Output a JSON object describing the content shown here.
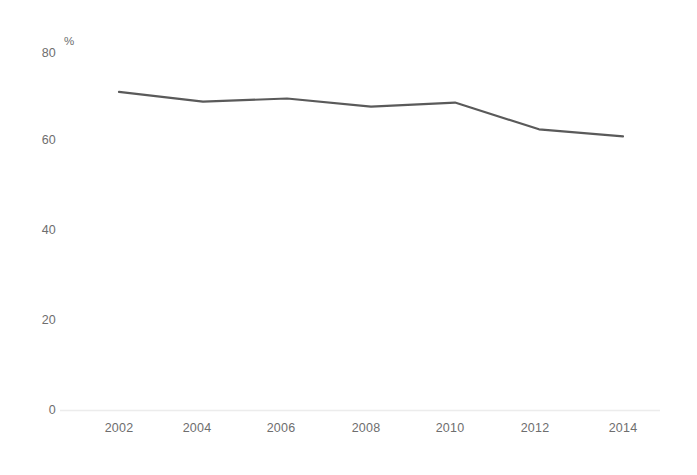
{
  "chart_data": {
    "type": "line",
    "title": "",
    "subtitle": "",
    "xlabel": "",
    "ylabel": "",
    "unit_label": "%",
    "x": [
      2002,
      2003,
      2004,
      2005,
      2006,
      2007,
      2008,
      2009,
      2010,
      2011,
      2012,
      2013,
      2014
    ],
    "categories": [
      "2002",
      "2004",
      "2006",
      "2008",
      "2010",
      "2012",
      "2014"
    ],
    "series": [
      {
        "name": "",
        "color": "#5a5a5a",
        "points": [
          {
            "x": 2002,
            "y": 71.3
          },
          {
            "x": 2004,
            "y": 69.1
          },
          {
            "x": 2006,
            "y": 69.8
          },
          {
            "x": 2008,
            "y": 68.0
          },
          {
            "x": 2010,
            "y": 68.9
          },
          {
            "x": 2012,
            "y": 62.9
          },
          {
            "x": 2014,
            "y": 61.3
          }
        ],
        "values": [
          71.3,
          69.1,
          69.8,
          68.0,
          68.9,
          62.9,
          61.3
        ]
      }
    ],
    "xlim": [
      2001.2,
      2015.0
    ],
    "ylim": [
      0,
      84
    ],
    "x_ticks": [
      2002,
      2004,
      2006,
      2008,
      2010,
      2012,
      2014
    ],
    "x_tick_labels": [
      "2002",
      "2004",
      "2006",
      "2008",
      "2010",
      "2012",
      "2014"
    ],
    "y_ticks": [
      0,
      20,
      40,
      60,
      80
    ],
    "y_tick_labels": [
      "0",
      "20",
      "40",
      "60",
      "80"
    ],
    "grid": false,
    "legend": false,
    "legend_position": "none",
    "axis_line_color": "#ececec",
    "tick_label_color": "#6e6e6e",
    "background_color": "#ffffff",
    "line_width": 2.2
  },
  "axis": {
    "y_labels": [
      "80",
      "60",
      "40",
      "20",
      "0"
    ],
    "x_labels": [
      "2002",
      "2004",
      "2006",
      "2008",
      "2010",
      "2012",
      "2014"
    ],
    "unit": "%"
  }
}
